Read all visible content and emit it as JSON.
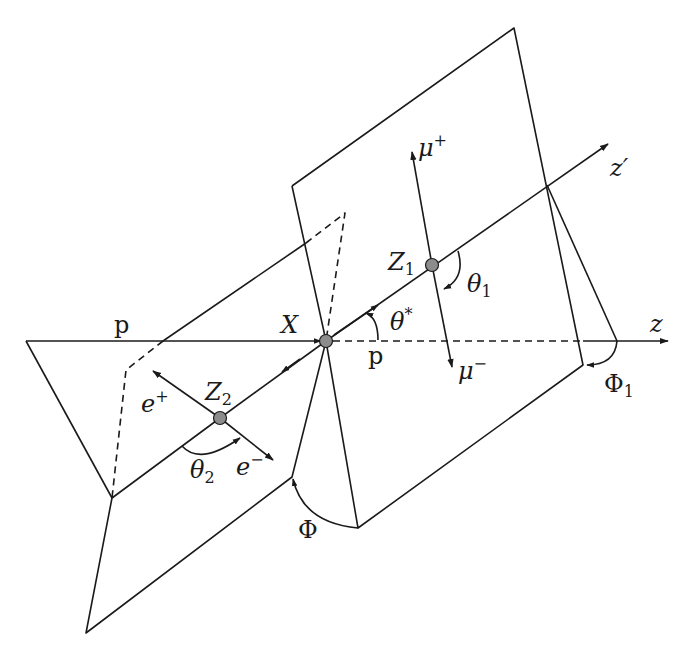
{
  "diagram": {
    "labels": {
      "z_prime_axis": "z′",
      "z_axis": "z",
      "beam_left": "p",
      "beam_right": "p",
      "resonance": "X",
      "z1": "Z",
      "z1_sub": "1",
      "z2": "Z",
      "z2_sub": "2",
      "mu_plus": "μ",
      "mu_plus_sup": "+",
      "mu_minus": "μ",
      "mu_minus_sup": "−",
      "e_plus": "e",
      "e_plus_sup": "+",
      "e_minus": "e",
      "e_minus_sup": "−",
      "theta_star": "θ",
      "theta_star_sup": "*",
      "theta1": "θ",
      "theta1_sub": "1",
      "theta2": "θ",
      "theta2_sub": "2",
      "phi": "Φ",
      "phi1": "Φ",
      "phi1_sub": "1"
    },
    "colors": {
      "line": "#1a1a1a",
      "vertex_fill": "#8c8c8c",
      "background": "#ffffff"
    }
  }
}
